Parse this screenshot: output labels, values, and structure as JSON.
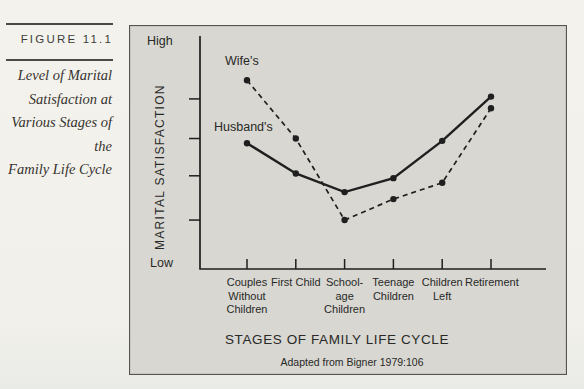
{
  "figure": {
    "label": "FIGURE 11.1",
    "caption_lines": [
      "Level of Marital",
      "Satisfaction at",
      "Various Stages of the",
      "Family Life Cycle"
    ]
  },
  "chart_data": {
    "type": "line",
    "title": "Level of Marital Satisfaction at Various Stages of the Family Life Cycle",
    "xlabel": "STAGES OF FAMILY LIFE CYCLE",
    "ylabel": "MARITAL SATISFACTION",
    "y_axis_labels": {
      "top": "High",
      "bottom": "Low"
    },
    "ylim": [
      0,
      100
    ],
    "y_ticks": [
      21,
      40,
      56,
      73
    ],
    "grid": false,
    "legend_position": "inline-labels",
    "categories": [
      "Couples Without Children",
      "First Child",
      "School-age Children",
      "Teenage Children",
      "Children Left",
      "Retirement"
    ],
    "series": [
      {
        "name": "Wife's",
        "line": "dashed",
        "values": [
          81,
          56,
          21,
          30,
          37,
          69
        ]
      },
      {
        "name": "Husband's",
        "line": "solid",
        "values": [
          54,
          41,
          33,
          39,
          55,
          74
        ]
      }
    ],
    "source_note": "Adapted from Bigner 1979:106"
  },
  "colors": {
    "ink": "#1f1f1f",
    "box_fill": "#d8d7d2",
    "box_border": "#56564e",
    "page_bg": "#f2f0ea",
    "text": "#292927"
  }
}
